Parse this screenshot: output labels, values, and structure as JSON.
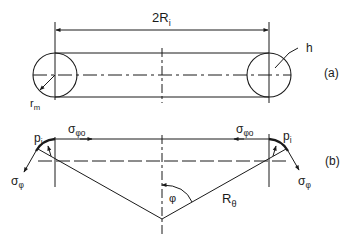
{
  "figure": {
    "part_a": {
      "label": "(a)",
      "dimension_label": "2R",
      "dimension_subscript": "i",
      "thickness_label": "h",
      "radius_label": "r",
      "radius_subscript": "m"
    },
    "part_b": {
      "label": "(b)",
      "pressure_left": "p",
      "pressure_left_sub": "i",
      "pressure_right": "p",
      "pressure_right_sub": "i",
      "stress_top_left": "σ",
      "stress_top_left_sub": "φo",
      "stress_top_right": "σ",
      "stress_top_right_sub": "φo",
      "stress_left": "σ",
      "stress_left_sub": "φ",
      "stress_right": "σ",
      "stress_right_sub": "φ",
      "angle_label": "φ",
      "radius_label": "R",
      "radius_subscript": "θ"
    },
    "colors": {
      "line": "#1a1a1a",
      "background": "#ffffff"
    }
  }
}
